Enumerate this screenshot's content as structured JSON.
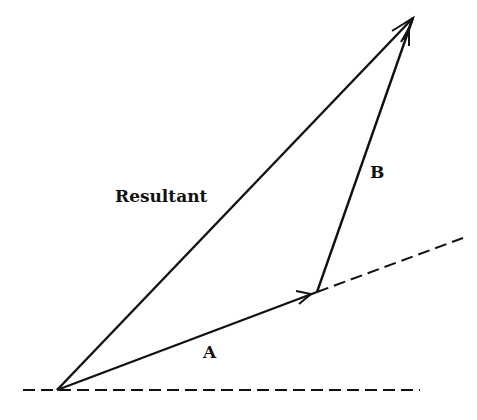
{
  "diagram": {
    "title": "",
    "type": "vector-addition",
    "labels": {
      "resultant": "Resultant",
      "a": "A",
      "b": "B"
    },
    "colors": {
      "stroke": "#111111",
      "background": "#ffffff"
    },
    "vectors": [
      {
        "name": "A",
        "from": [
          57,
          390
        ],
        "to": [
          317,
          292
        ]
      },
      {
        "name": "B",
        "from": [
          317,
          292
        ],
        "to": [
          413,
          18
        ]
      },
      {
        "name": "Resultant",
        "from": [
          57,
          390
        ],
        "to": [
          413,
          18
        ]
      }
    ],
    "reference_lines": [
      {
        "name": "horizontal-baseline",
        "from": [
          23,
          390
        ],
        "to": [
          420,
          390
        ],
        "style": "dashed"
      },
      {
        "name": "a-extension",
        "from": [
          317,
          292
        ],
        "to": [
          463,
          238
        ],
        "style": "dashed"
      }
    ]
  }
}
